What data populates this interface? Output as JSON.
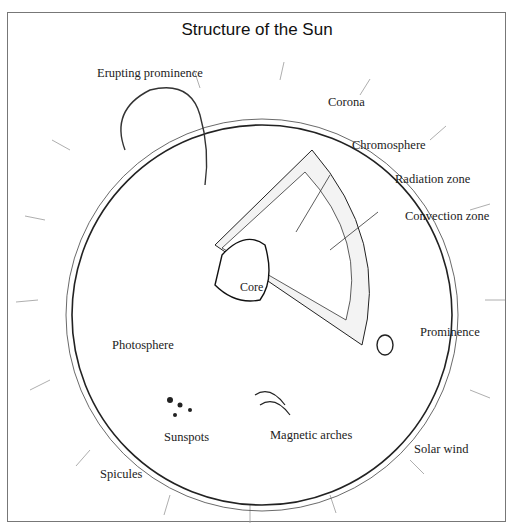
{
  "title": "Structure of the Sun",
  "labels": {
    "erupting_prominence": "Erupting prominence",
    "corona": "Corona",
    "chromosphere": "Chromosphere",
    "radiation_zone": "Radiation zone",
    "convection_zone": "Convection zone",
    "core": "Core",
    "prominence": "Prominence",
    "photosphere": "Photosphere",
    "sunspots": "Sunspots",
    "magnetic_arches": "Magnetic arches",
    "solar_wind": "Solar wind",
    "spicules": "Spicules"
  },
  "colors": {
    "ink": "#222222",
    "frame": "#777777",
    "background": "#ffffff"
  }
}
